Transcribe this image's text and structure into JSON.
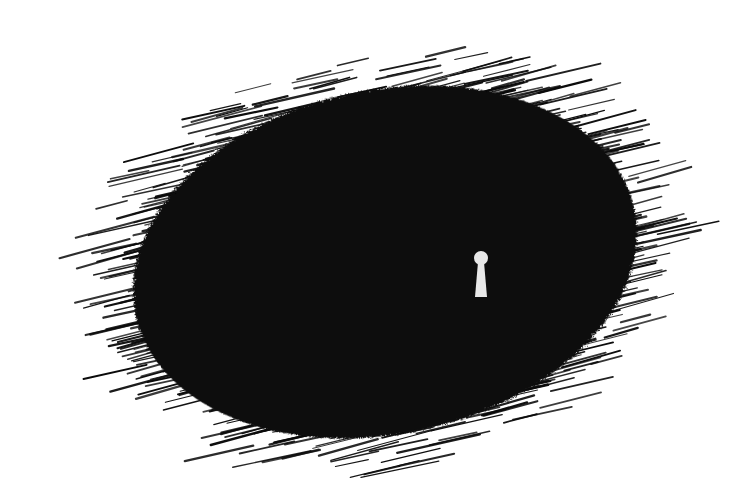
{
  "illustration": {
    "subject": "dark hatched blob with keyhole",
    "background_color": "#ffffff",
    "ink_color": "#0a0a0a",
    "keyhole_color": "#e8e8e8",
    "blob": {
      "cx": 385,
      "cy": 258,
      "rx": 295,
      "ry": 205,
      "rotation": -12
    },
    "keyhole": {
      "cx": 481,
      "cy": 258,
      "head_r": 7,
      "stem_top": 263,
      "stem_bottom": 297,
      "stem_top_half_width": 3,
      "stem_bottom_half_width": 6
    }
  }
}
